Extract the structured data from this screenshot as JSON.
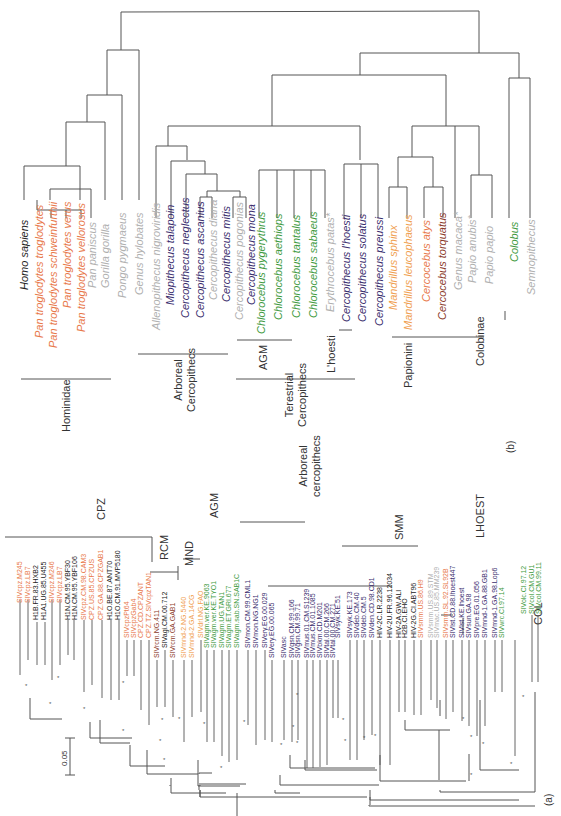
{
  "colors": {
    "chimp": "#e8784a",
    "mandrill": "#f0a050",
    "guenon": "#3a2e6e",
    "agm": "#3e9a3e",
    "gray": "#b0b0b0",
    "black": "#222222",
    "redbrown": "#8b3a2a"
  },
  "panel_b": {
    "label": "(b)",
    "taxa": [
      {
        "name": "Homo sapiens",
        "color": "black"
      },
      {
        "name": "Pan troglodytes troglodytes",
        "color": "chimp"
      },
      {
        "name": "Pan troglodytes schweinfurthii",
        "color": "chimp"
      },
      {
        "name": "Pan troglodytes verus",
        "color": "chimp"
      },
      {
        "name": "Pan troglodytes vellorosus",
        "color": "chimp"
      },
      {
        "name": "Pan paniscus",
        "color": "gray"
      },
      {
        "name": "Gorilla gorilla",
        "color": "gray"
      },
      {
        "name": "Pongo pygmaeus",
        "color": "gray"
      },
      {
        "name": "Genus hylobates",
        "color": "gray"
      },
      {
        "name": "Allenopithecus nigroviridis",
        "color": "gray"
      },
      {
        "name": "Miopithecus talapoin",
        "color": "guenon"
      },
      {
        "name": "Cercopithecus neglectus",
        "color": "guenon"
      },
      {
        "name": "Cercopithecus ascanius",
        "color": "guenon"
      },
      {
        "name": "Cercopithecus diana",
        "color": "gray"
      },
      {
        "name": "Cercopithecus mitis",
        "color": "guenon"
      },
      {
        "name": "Cercopithecus pogonias",
        "color": "gray"
      },
      {
        "name": "Cercopithecus mona",
        "color": "guenon"
      },
      {
        "name": "Chlorocebus pygerythrus",
        "color": "agm"
      },
      {
        "name": "Chlorocebus aethiops",
        "color": "agm"
      },
      {
        "name": "Chlorocebus tantalus",
        "color": "agm"
      },
      {
        "name": "Chlorocebus sabaeus",
        "color": "agm"
      },
      {
        "name": "Erythrocebus patas*",
        "color": "gray"
      },
      {
        "name": "Cercopithecus l'hoesti",
        "color": "guenon"
      },
      {
        "name": "Cercopithecus solatus",
        "color": "guenon"
      },
      {
        "name": "Cercopithecus preussi",
        "color": "guenon"
      },
      {
        "name": "Mandrillus sphinx",
        "color": "mandrill"
      },
      {
        "name": "Mandrillus leucophaeus",
        "color": "mandrill"
      },
      {
        "name": "Cercocebus atys",
        "color": "chimp"
      },
      {
        "name": "Cercocebus torquatus",
        "color": "redbrown"
      },
      {
        "name": "Genus macaca*",
        "color": "gray"
      },
      {
        "name": "Papio anubis*",
        "color": "gray"
      },
      {
        "name": "Papio papio",
        "color": "gray"
      },
      {
        "name": "Colobus",
        "color": "agm"
      },
      {
        "name": "Semnopithecus",
        "color": "gray"
      }
    ],
    "groups": [
      {
        "name": "Hominidae"
      },
      {
        "name": "Arboreal Cercopithecs"
      },
      {
        "name": "AGM"
      },
      {
        "name": "L'hoesti"
      },
      {
        "name": "Terestrial Cercopithecs"
      },
      {
        "name": "Papionini"
      },
      {
        "name": "Colobinae"
      }
    ]
  },
  "panel_a": {
    "label": "(a)",
    "scale_bar": "0.05",
    "clades": [
      {
        "name": "CPZ"
      },
      {
        "name": "RCM"
      },
      {
        "name": "MND"
      },
      {
        "name": "AGM"
      },
      {
        "name": "Arboreal cercopithecs"
      },
      {
        "name": "SMM"
      },
      {
        "name": "LHOEST"
      },
      {
        "name": "COL"
      }
    ],
    "sequences": [
      {
        "name": "SIVcpz.M245",
        "color": "chimp"
      },
      {
        "name": "SIVcpz.LB7",
        "color": "chimp"
      },
      {
        "name": "H1B.FR.83.HXB2",
        "color": "black"
      },
      {
        "name": "H1A1.UG.85.U455",
        "color": "black"
      },
      {
        "name": "SIVcpz.M246",
        "color": "chimp"
      },
      {
        "name": "SIVcpz.LB7",
        "color": "chimp"
      },
      {
        "name": "H1N.CM.95.YBF30",
        "color": "black"
      },
      {
        "name": "H1N.CM.95.YBF106",
        "color": "black"
      },
      {
        "name": "SIVcpz.CM.98.CAM3",
        "color": "chimp"
      },
      {
        "name": "CPZ.US.85.CPZUS",
        "color": "chimp"
      },
      {
        "name": "CPZ.GA.88.CPZGAB1",
        "color": "chimp"
      },
      {
        "name": "H1O.BE.87.ANT70",
        "color": "black"
      },
      {
        "name": "H1O.CM.91.MVP5180",
        "color": "black"
      },
      {
        "name": "SIVcpzPt64",
        "color": "chimp"
      },
      {
        "name": "SIVcpzGab4",
        "color": "chimp"
      },
      {
        "name": "CPZ.CD.CPZANT",
        "color": "chimp"
      },
      {
        "name": "CPZ.TZ.SIVcpzTAN1",
        "color": "chimp"
      },
      {
        "name": "SIVrcm.NG.411",
        "color": "redbrown"
      },
      {
        "name": "SIVagi.CM.00.712",
        "color": "black"
      },
      {
        "name": "SIVrcm.GA.GAB1",
        "color": "redbrown"
      },
      {
        "name": "SIVmnd-2.NG.5440",
        "color": "mandrill"
      },
      {
        "name": "SIVmnd-2.GA.14CG",
        "color": "mandrill"
      },
      {
        "name": "SIVdrl.NG.FAO",
        "color": "mandrill"
      },
      {
        "name": "SIVagm.ver.KE.9063",
        "color": "agm"
      },
      {
        "name": "SIVagm.ver.KE.TYO1",
        "color": "agm"
      },
      {
        "name": "SIVagm.UG.TAN1",
        "color": "agm"
      },
      {
        "name": "SIVagm.ET.GRI.677",
        "color": "agm"
      },
      {
        "name": "SIVagm.sab.SN.SAB1C",
        "color": "agm"
      },
      {
        "name": "SIVmon.CM.99.CML1",
        "color": "guenon"
      },
      {
        "name": "SIVmon.NG.NG1",
        "color": "guenon"
      },
      {
        "name": "SIVery.EG.00.029",
        "color": "guenon"
      },
      {
        "name": "SIVery.EG.00.065",
        "color": "guenon"
      },
      {
        "name": "SIVasc",
        "color": "guenon"
      },
      {
        "name": "SIVgsn.CM.99.166",
        "color": "guenon"
      },
      {
        "name": "SIVgsn.CM.99.71",
        "color": "guenon"
      },
      {
        "name": "SIVmus.01.CM.S1239",
        "color": "guenon"
      },
      {
        "name": "SIVmus.CM.01.1085",
        "color": "guenon"
      },
      {
        "name": "SIVbkm.CD.M201",
        "color": "guenon"
      },
      {
        "name": "SIVtal.00.CM.266",
        "color": "guenon"
      },
      {
        "name": "SIVtal.00.CM.271",
        "color": "guenon"
      },
      {
        "name": "SIVsyk.KE.51",
        "color": "guenon"
      },
      {
        "name": "SIVsyk.KE.173",
        "color": "guenon"
      },
      {
        "name": "SIVdeb.CM.40",
        "color": "guenon"
      },
      {
        "name": "SIVdeb.CM.5",
        "color": "guenon"
      },
      {
        "name": "SIVden.CD.98.CD1",
        "color": "guenon"
      },
      {
        "name": "HIV-2C.LR.2238",
        "color": "black"
      },
      {
        "name": "HIV-2U.FR.96.12034",
        "color": "black"
      },
      {
        "name": "HIV-2A.GW.ALI",
        "color": "black"
      },
      {
        "name": "H2B.CI.EHO",
        "color": "black"
      },
      {
        "name": "HIV-2G.CI.ABT96",
        "color": "black"
      },
      {
        "name": "SIVsmm.US.86.H9",
        "color": "chimp"
      },
      {
        "name": "SIVsmm.US.89.STM",
        "color": "gray"
      },
      {
        "name": "SIVmac.US.85.MM239",
        "color": "gray"
      },
      {
        "name": "SIVsmm.SL.92.SL92B",
        "color": "chimp"
      },
      {
        "name": "SIVlst.CD.88.lhoest447",
        "color": "guenon"
      },
      {
        "name": "SIVlst.KE.lhoest",
        "color": "guenon"
      },
      {
        "name": "SIVsun.GA.98",
        "color": "guenon"
      },
      {
        "name": "SIVpre.EG.01.056",
        "color": "guenon"
      },
      {
        "name": "SIVmnd-1.GA.88.GB1",
        "color": "guenon"
      },
      {
        "name": "SIVmnd-1.GA.98.Lop6",
        "color": "guenon"
      },
      {
        "name": "SIVwrc.CI.97.14",
        "color": "agm"
      },
      {
        "name": "SIVolc.CI.97.12",
        "color": "agm"
      },
      {
        "name": "SIVcol.CM.GU1",
        "color": "agm"
      },
      {
        "name": "SIVcol.CM.99.11",
        "color": "agm"
      }
    ]
  }
}
